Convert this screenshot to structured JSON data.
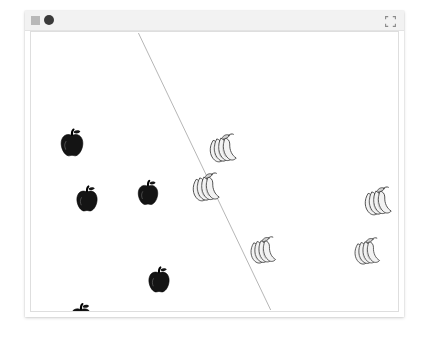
{
  "window": {
    "titlebar": {
      "left_icons": [
        {
          "name": "window-menu-icon",
          "shape": "square",
          "color": "#b9b9b9"
        },
        {
          "name": "record-dot-icon",
          "shape": "circle",
          "color": "#3a3a3a"
        }
      ],
      "expand_icon": {
        "name": "expand-fullscreen-icon",
        "color": "#888888"
      }
    }
  },
  "plot": {
    "type": "scatter",
    "background": "#ffffff",
    "border_color": "#dedede",
    "boundary_line": {
      "name": "decision-boundary-line",
      "color": "#b5b5b5",
      "width": 1,
      "x1": 108,
      "y1": 1,
      "x2": 241,
      "y2": 280
    },
    "classes": [
      {
        "label": "apple",
        "fill": "#141414",
        "stroke": "#000000"
      },
      {
        "label": "banana",
        "fill": "#f2f2f2",
        "stroke": "#3a3a3a"
      }
    ],
    "points": [
      {
        "class": "apple",
        "x": 41,
        "y": 111,
        "size": 30
      },
      {
        "class": "apple",
        "x": 56,
        "y": 167,
        "size": 28
      },
      {
        "class": "apple",
        "x": 117,
        "y": 161,
        "size": 27
      },
      {
        "class": "apple",
        "x": 128,
        "y": 248,
        "size": 28
      },
      {
        "class": "apple",
        "x": 50,
        "y": 285,
        "size": 29
      },
      {
        "class": "banana",
        "x": 193,
        "y": 117,
        "size": 36
      },
      {
        "class": "banana",
        "x": 176,
        "y": 156,
        "size": 36
      },
      {
        "class": "banana",
        "x": 233,
        "y": 219,
        "size": 34
      },
      {
        "class": "banana",
        "x": 348,
        "y": 170,
        "size": 36
      },
      {
        "class": "banana",
        "x": 337,
        "y": 220,
        "size": 34
      }
    ]
  }
}
